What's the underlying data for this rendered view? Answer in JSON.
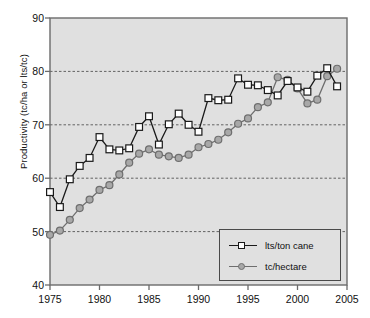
{
  "chart_data": {
    "type": "line",
    "title": "",
    "xlabel": "",
    "ylabel": "Productivity (tc/ha or lts/tc)",
    "xlim": [
      1975,
      2005
    ],
    "ylim": [
      40,
      90
    ],
    "xticks": [
      1975,
      1980,
      1985,
      1990,
      1995,
      2000,
      2005
    ],
    "yticks": [
      40,
      50,
      60,
      70,
      80,
      90
    ],
    "grid": "horizontal-dashed",
    "gridlines": [
      50,
      60,
      70,
      80
    ],
    "legend_position": "lower-right",
    "plot_background": "#e0e0e0",
    "x": [
      1975,
      1976,
      1977,
      1978,
      1979,
      1980,
      1981,
      1982,
      1983,
      1984,
      1985,
      1986,
      1987,
      1988,
      1989,
      1990,
      1991,
      1992,
      1993,
      1994,
      1995,
      1996,
      1997,
      1998,
      1999,
      2000,
      2001,
      2002,
      2003,
      2004
    ],
    "series": [
      {
        "name": "lts/ton cane",
        "marker": "square",
        "marker_fill": "#ffffff",
        "line_color": "#1a1a1a",
        "values": [
          57.4,
          54.6,
          59.8,
          62.3,
          63.8,
          67.7,
          65.4,
          65.2,
          65.6,
          69.6,
          71.6,
          66.3,
          70.1,
          72.1,
          70.0,
          68.7,
          75.0,
          74.6,
          74.7,
          78.7,
          77.5,
          77.4,
          76.5,
          75.5,
          78.2,
          77.0,
          76.2,
          79.2,
          80.6,
          77.2
        ]
      },
      {
        "name": "tc/hectare",
        "marker": "circle",
        "marker_fill": "#a8a8a8",
        "line_color": "#6e6e6e",
        "values": [
          49.4,
          50.2,
          52.2,
          54.4,
          56.0,
          57.8,
          58.7,
          60.7,
          62.9,
          64.6,
          65.4,
          64.4,
          64.1,
          63.8,
          64.4,
          65.8,
          66.4,
          67.2,
          68.6,
          70.2,
          71.2,
          73.3,
          74.2,
          78.9,
          78.4,
          76.8,
          74.0,
          74.7,
          79.1,
          80.5
        ]
      }
    ]
  },
  "legend": {
    "entries": [
      {
        "label": "lts/ton cane",
        "marker": "square-icon"
      },
      {
        "label": "tc/hectare",
        "marker": "circle-icon"
      }
    ]
  },
  "colors": {
    "plot_bg": "#e0e0e0",
    "axis": "#6b6b6b",
    "grid": "#555555",
    "series1_line": "#1a1a1a",
    "series1_fill": "#ffffff",
    "series2_line": "#6e6e6e",
    "series2_fill": "#a8a8a8",
    "text": "#111111"
  }
}
